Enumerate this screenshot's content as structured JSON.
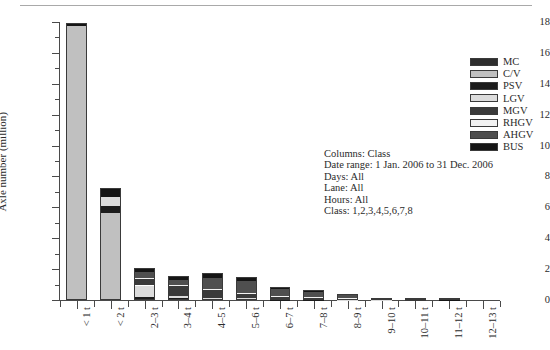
{
  "chart_data": {
    "type": "bar",
    "stacked": true,
    "title": "",
    "xlabel": "",
    "ylabel": "Axle number (million)",
    "ylim": [
      0,
      18
    ],
    "ytick_step": 2,
    "yminor_step": 1,
    "grid": false,
    "legend_position": "right",
    "categories": [
      "< 1 t",
      "< 2 t",
      "2–3 t",
      "3–4 t",
      "4–5 t",
      "5–6 t",
      "6–7 t",
      "7–8 t",
      "8–9 t",
      "9–10 t",
      "10–11 t",
      "11–12 t",
      "12–13 t"
    ],
    "yticks": [
      0,
      2,
      4,
      6,
      8,
      10,
      12,
      14,
      16,
      18
    ],
    "ytick_labels": [
      "0",
      "2",
      "4",
      "6",
      "8",
      "10",
      "12",
      "14",
      "16",
      "18"
    ],
    "series": [
      {
        "name": "MC",
        "color": "#2e2e2e",
        "values": [
          0.0,
          0.0,
          0.0,
          0.0,
          0.0,
          0.0,
          0.0,
          0.0,
          0.0,
          0.0,
          0.0,
          0.0,
          0.0
        ]
      },
      {
        "name": "C/V",
        "color": "#c0c0c0",
        "values": [
          17.75,
          5.65,
          0.0,
          0.0,
          0.0,
          0.0,
          0.0,
          0.0,
          0.0,
          0.0,
          0.0,
          0.0,
          0.0
        ]
      },
      {
        "name": "PSV",
        "color": "#1c1c1c",
        "values": [
          0.0,
          0.45,
          0.22,
          0.1,
          0.06,
          0.04,
          0.03,
          0.02,
          0.01,
          0.01,
          0.0,
          0.0,
          0.0
        ]
      },
      {
        "name": "LGV",
        "color": "#dcdcdc",
        "values": [
          0.0,
          0.55,
          0.72,
          0.18,
          0.1,
          0.06,
          0.04,
          0.03,
          0.02,
          0.01,
          0.0,
          0.0,
          0.0
        ]
      },
      {
        "name": "MGV",
        "color": "#3a3a3a",
        "values": [
          0.0,
          0.0,
          0.4,
          0.6,
          0.5,
          0.34,
          0.2,
          0.14,
          0.08,
          0.04,
          0.01,
          0.0,
          0.0
        ]
      },
      {
        "name": "RHGV",
        "color": "#f2f2f2",
        "values": [
          0.0,
          0.0,
          0.1,
          0.08,
          0.05,
          0.03,
          0.02,
          0.01,
          0.01,
          0.0,
          0.0,
          0.0,
          0.0
        ]
      },
      {
        "name": "AHGV",
        "color": "#4f4f4f",
        "values": [
          0.0,
          0.0,
          0.36,
          0.36,
          0.7,
          0.78,
          0.42,
          0.32,
          0.18,
          0.08,
          0.03,
          0.02,
          0.0
        ]
      },
      {
        "name": "BUS",
        "color": "#151515",
        "values": [
          0.2,
          0.6,
          0.3,
          0.23,
          0.34,
          0.22,
          0.14,
          0.1,
          0.06,
          0.02,
          0.01,
          0.01,
          0.0
        ]
      }
    ],
    "totals": [
      17.95,
      7.25,
      2.1,
      1.55,
      1.75,
      1.47,
      0.85,
      0.62,
      0.36,
      0.16,
      0.05,
      0.03,
      0.0
    ]
  },
  "legend": {
    "items": [
      {
        "label": "MC"
      },
      {
        "label": "C/V"
      },
      {
        "label": "PSV"
      },
      {
        "label": "LGV"
      },
      {
        "label": "MGV"
      },
      {
        "label": "RHGV"
      },
      {
        "label": "AHGV"
      },
      {
        "label": "BUS"
      }
    ]
  },
  "annotation": {
    "lines": [
      "Columns: Class",
      "Date range: 1 Jan. 2006 to 31 Dec. 2006",
      "Days: All",
      "Lane: All",
      "Hours: All",
      "Class: 1,2,3,4,5,6,7,8"
    ]
  }
}
